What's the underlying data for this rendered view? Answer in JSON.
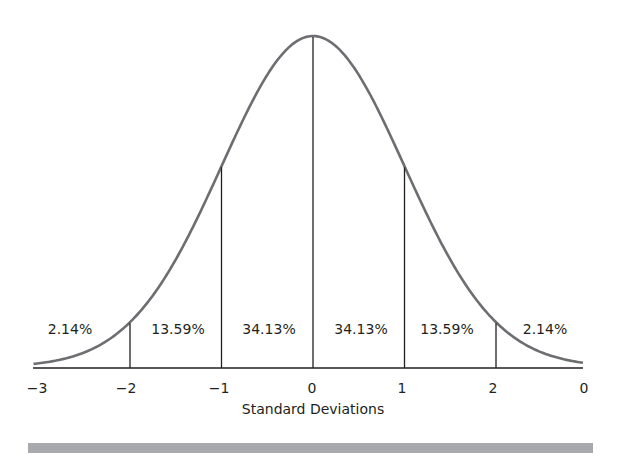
{
  "chart_data": {
    "type": "area",
    "title": "",
    "xlabel": "Standard Deviations",
    "ylabel": "",
    "x_tick_labels": [
      "−3",
      "−2",
      "−1",
      "0",
      "1",
      "2",
      "0"
    ],
    "x_tick_values": [
      -3,
      -2,
      -1,
      0,
      1,
      2,
      3
    ],
    "xlim": [
      -3,
      3
    ],
    "grid": false,
    "legend": null,
    "curve": "normal distribution (bell curve), mean 0, sd 1",
    "dividers_at": [
      -2,
      -1,
      0,
      1,
      2
    ],
    "categories": [
      "-3 to -2",
      "-2 to -1",
      "-1 to 0",
      "0 to 1",
      "1 to 2",
      "2 to 3"
    ],
    "values": [
      2.14,
      13.59,
      34.13,
      34.13,
      13.59,
      2.14
    ],
    "region_labels": [
      "2.14%",
      "13.59%",
      "34.13%",
      "34.13%",
      "13.59%",
      "2.14%"
    ],
    "colors": {
      "curve": "#6d6e71",
      "lines": "#231f20",
      "footer_bar": "#a7a9ac"
    }
  }
}
